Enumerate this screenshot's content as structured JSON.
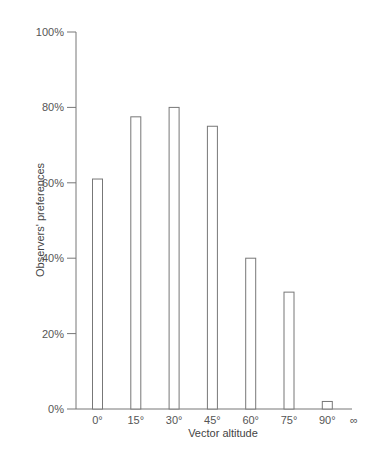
{
  "chart_data": {
    "type": "bar",
    "title": "",
    "xlabel": "Vector altitude",
    "ylabel": "Observers' preferences",
    "categories": [
      "0°",
      "15°",
      "30°",
      "45°",
      "60°",
      "75°",
      "90°",
      "∞"
    ],
    "values": [
      61,
      77.5,
      80,
      75,
      40,
      31,
      2,
      null
    ],
    "ylim": [
      0,
      100
    ],
    "yticks": [
      0,
      20,
      40,
      60,
      80,
      100
    ],
    "ytick_labels": [
      "0%",
      "20%",
      "40%",
      "60%",
      "80%",
      "100%"
    ],
    "grid": false,
    "legend": null
  }
}
